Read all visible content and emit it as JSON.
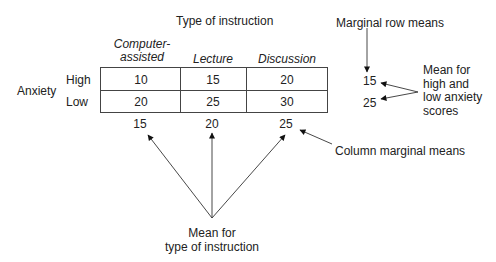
{
  "title": "Type of instruction",
  "columns": [
    "Computer-\nassisted",
    "Lecture",
    "Discussion"
  ],
  "column_lines": [
    [
      "Computer-",
      "assisted"
    ],
    "Lecture",
    "Discussion"
  ],
  "factor_label": "Anxiety",
  "rows": [
    {
      "label": "High",
      "values": [
        "10",
        "15",
        "20"
      ],
      "row_mean": "15"
    },
    {
      "label": "Low",
      "values": [
        "20",
        "25",
        "30"
      ],
      "row_mean": "25"
    }
  ],
  "column_means": [
    "15",
    "20",
    "25"
  ],
  "annotations": {
    "marginal_row_means": "Marginal row means",
    "row_mean_note": [
      "Mean for",
      "high and",
      "low anxiety",
      "scores"
    ],
    "column_marginal_means": "Column marginal means",
    "instruction_mean_note": [
      "Mean for",
      "type of instruction"
    ]
  },
  "colors": {
    "line": "#444444",
    "text": "#222222",
    "background": "#ffffff"
  }
}
